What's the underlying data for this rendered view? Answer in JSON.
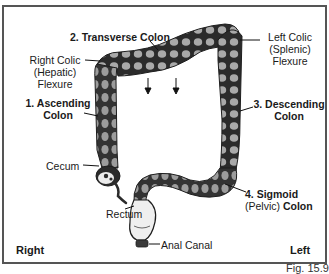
{
  "figure": {
    "caption": "Fig. 15.9",
    "orientation": {
      "left_side_label": "Right",
      "right_side_label": "Left"
    },
    "labels": {
      "transverse": {
        "number": "2.",
        "name": "Transverse Colon"
      },
      "right_flexure": {
        "line1": "Right Colic",
        "line2": "(Hepatic)",
        "line3": "Flexure"
      },
      "left_flexure": {
        "line1": "Left Colic",
        "line2": "(Splenic)",
        "line3": "Flexure"
      },
      "ascending": {
        "line1": "1. Ascending",
        "line2": "Colon"
      },
      "descending": {
        "line1": "3. Descending",
        "line2": "Colon"
      },
      "cecum": "Cecum",
      "sigmoid": {
        "line1": "4. Sigmoid",
        "paren": "(Pelvic)",
        "bold": "Colon"
      },
      "rectum": "Rectum",
      "anal_canal": "Anal Canal"
    },
    "colors": {
      "colon_dark": "#2b2b2b",
      "colon_haustra": "#a9a9a9",
      "frame": "#555555",
      "text": "#1a1a1a"
    }
  }
}
